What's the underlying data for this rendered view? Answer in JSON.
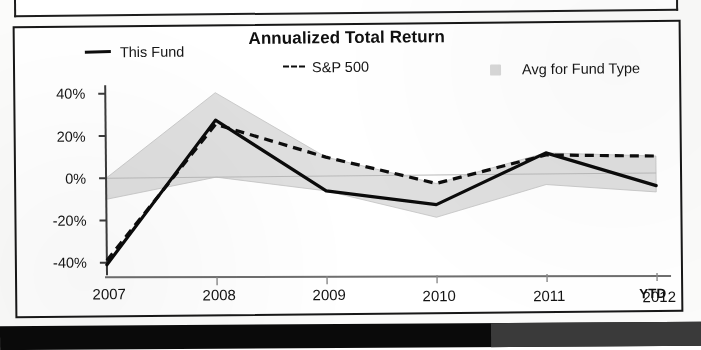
{
  "chart_panel": {
    "title": "Annualized Total Return",
    "ytd_note": "YTD"
  },
  "legend": {
    "items": [
      {
        "label": "This Fund",
        "marker": "solid-line-swatch",
        "color": "#0d0d0d"
      },
      {
        "label": "S&P 500",
        "marker": "dashed-line-swatch",
        "color": "#0d0d0d"
      },
      {
        "label": "Avg for Fund Type",
        "marker": "gray-square-swatch",
        "color": "#d8d8d8"
      }
    ]
  },
  "chart_data": {
    "type": "line",
    "title": "Annualized Total Return",
    "subtitle": "",
    "xlabel": "",
    "ylabel": "",
    "x": [
      "2007",
      "2008",
      "2009",
      "2010",
      "2011",
      "2012"
    ],
    "categories": [
      "2007",
      "2008",
      "2009",
      "2010",
      "2011",
      "2012"
    ],
    "ytick_labels": [
      "40%",
      "20%",
      "0%",
      "-20%",
      "-40%"
    ],
    "ytick_values": [
      40,
      20,
      0,
      -20,
      -40
    ],
    "ylim": [
      -46,
      44
    ],
    "xlim": [
      2007,
      2012
    ],
    "grid": false,
    "zero_line": true,
    "legend_position": "top",
    "series": [
      {
        "name": "This Fund",
        "style": "solid",
        "color": "#0d0d0d",
        "values": [
          -41,
          27,
          -7,
          -14,
          10,
          -6
        ]
      },
      {
        "name": "S&P 500",
        "style": "dashed",
        "color": "#0d0d0d",
        "values": [
          -39,
          25,
          9,
          -4,
          9,
          8
        ]
      },
      {
        "name": "Avg for Fund Type",
        "style": "band",
        "color": "#d8d8d8",
        "values_upper": [
          0,
          40,
          9,
          -4,
          10,
          8
        ],
        "values_lower": [
          -10,
          0,
          -7,
          -20,
          -5,
          -9
        ]
      }
    ]
  }
}
